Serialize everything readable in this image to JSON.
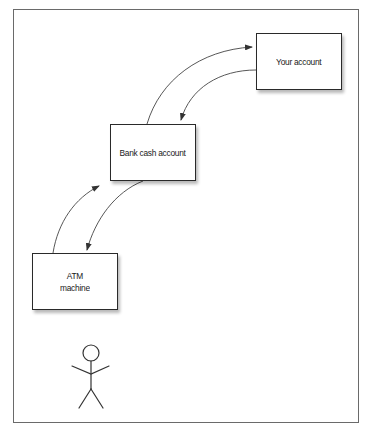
{
  "diagram": {
    "title": "",
    "nodes": [
      {
        "id": "your-account",
        "label": "Your account"
      },
      {
        "id": "bank-cash-account",
        "label": "Bank cash account"
      },
      {
        "id": "atm-machine",
        "label": "ATM\nmachine"
      }
    ],
    "edges": [
      {
        "from": "bank-cash-account",
        "to": "your-account"
      },
      {
        "from": "your-account",
        "to": "bank-cash-account"
      },
      {
        "from": "atm-machine",
        "to": "bank-cash-account"
      },
      {
        "from": "bank-cash-account",
        "to": "atm-machine"
      }
    ],
    "actor": {
      "id": "user",
      "icon": "stick-figure-icon"
    },
    "colors": {
      "border": "#2a2a2a",
      "frame": "#6a6a6a",
      "arrow": "#444444",
      "text": "#1a1a1a",
      "background": "#ffffff"
    }
  }
}
